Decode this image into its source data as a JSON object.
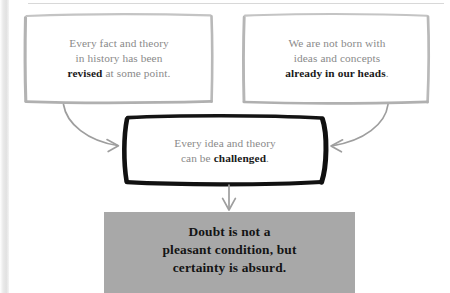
{
  "diagram": {
    "colors": {
      "soft_box_border": "#b0b0b0",
      "strong_box_border": "#111111",
      "body_text": "#8a8a8a",
      "emphasis_text": "#1a1a1a",
      "band_fill": "#a8a8a8",
      "band_text": "#141414",
      "arrow": "#9a9a9a"
    },
    "nodes": [
      {
        "id": "premise-left",
        "style": "hand-drawn-light",
        "lines": [
          {
            "text": "Every fact and theory",
            "emphasis": null
          },
          {
            "text": "in history has been",
            "emphasis": null
          },
          {
            "text": "revised at some point.",
            "emphasis": "revised"
          }
        ],
        "plain_text": "Every fact and theory in history has been revised at some point."
      },
      {
        "id": "premise-right",
        "style": "hand-drawn-light",
        "lines": [
          {
            "text": "We are not born with",
            "emphasis": null
          },
          {
            "text": "ideas and concepts",
            "emphasis": null
          },
          {
            "text": "already in our heads.",
            "emphasis": "already in our heads"
          }
        ],
        "plain_text": "We are not born with ideas and concepts already in our heads."
      },
      {
        "id": "inference",
        "style": "hand-drawn-bold",
        "lines": [
          {
            "text": "Every idea and theory",
            "emphasis": null
          },
          {
            "text": "can be challenged.",
            "emphasis": "challenged"
          }
        ],
        "plain_text": "Every idea and theory can be challenged."
      },
      {
        "id": "conclusion",
        "style": "solid-gray-band",
        "lines": [
          {
            "text": "Doubt is not a",
            "emphasis": null
          },
          {
            "text": "pleasant condition, but",
            "emphasis": null
          },
          {
            "text": "certainty is absurd.",
            "emphasis": null
          }
        ],
        "plain_text": "Doubt is not a pleasant condition, but certainty is absurd."
      }
    ],
    "edges": [
      {
        "id": "edge-left-to-inference",
        "from": "premise-left",
        "to": "inference",
        "shape": "curved",
        "arrowhead": "open-v"
      },
      {
        "id": "edge-right-to-inference",
        "from": "premise-right",
        "to": "inference",
        "shape": "curved",
        "arrowhead": "open-v"
      },
      {
        "id": "edge-inference-to-conclusion",
        "from": "inference",
        "to": "conclusion",
        "shape": "straight-down",
        "arrowhead": "open-v"
      }
    ]
  },
  "box1": {
    "line1": "Every fact and theory",
    "line2": "in history has been",
    "line3_bold": "revised",
    "line3_rest": " at some point."
  },
  "box2": {
    "line1": "We are not born with",
    "line2": "ideas and concepts",
    "line3_bold": "already in our heads",
    "line3_rest": "."
  },
  "box3": {
    "line1": "Every idea and theory",
    "line2_pre": "can be ",
    "line2_bold": "challenged",
    "line2_rest": "."
  },
  "band": {
    "line1": "Doubt is not a",
    "line2": "pleasant condition, but",
    "line3": "certainty is absurd."
  }
}
